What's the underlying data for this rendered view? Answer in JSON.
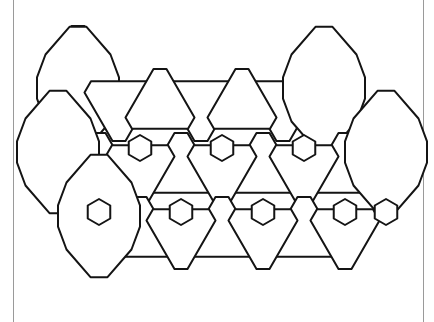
{
  "page": {
    "width": 434,
    "height": 322,
    "background_color": "#ffffff"
  },
  "frame": {
    "name": "page-border-rules",
    "color": "#9a9a9a",
    "left_x": 13,
    "right_x": 423,
    "stroke_width": 1
  },
  "figure": {
    "name": "tessellation-figure",
    "line_color": "#141414",
    "line_width": 2,
    "fill_color": "#ffffff",
    "bounds": {
      "x": 48,
      "y": 24,
      "width": 356,
      "height": 248
    },
    "lattice": {
      "col_pitch": 82,
      "row_pitch": 64,
      "row_offset": 41,
      "triangle_side": 82,
      "truncation": 13,
      "hex_radius": 13
    },
    "counts": {
      "truncated_triangles_up": 10,
      "truncated_triangles_down": 9,
      "truncated_hexagons": 6,
      "small_hexagons": 9
    },
    "shapes": [
      {
        "id": "tri-up-0",
        "type": "truncated-triangle",
        "orientation": "up",
        "cx": 78,
        "cy": 62
      },
      {
        "id": "hex-0",
        "type": "truncated-hexagon",
        "orientation": "flat",
        "cx": 78,
        "cy": 105
      },
      {
        "id": "tri-dn-0",
        "type": "truncated-triangle",
        "orientation": "down",
        "cx": 119,
        "cy": 105
      },
      {
        "id": "hex-1",
        "type": "truncated-hexagon",
        "orientation": "flat",
        "cx": 160,
        "cy": 105
      },
      {
        "id": "tri-dn-1",
        "type": "truncated-triangle",
        "orientation": "down",
        "cx": 201,
        "cy": 105
      },
      {
        "id": "hex-2",
        "type": "truncated-hexagon",
        "orientation": "flat",
        "cx": 242,
        "cy": 105
      },
      {
        "id": "tri-dn-2",
        "type": "truncated-triangle",
        "orientation": "down",
        "cx": 283,
        "cy": 105
      },
      {
        "id": "hex-3",
        "type": "truncated-hexagon",
        "orientation": "flat",
        "cx": 324,
        "cy": 105
      },
      {
        "id": "sh-r1-0",
        "type": "small-hexagon",
        "cx": 140,
        "cy": 148
      },
      {
        "id": "sh-r1-1",
        "type": "small-hexagon",
        "cx": 222,
        "cy": 148
      },
      {
        "id": "sh-r1-2",
        "type": "small-hexagon",
        "cx": 304,
        "cy": 148
      },
      {
        "id": "tri-up-1",
        "type": "truncated-triangle",
        "orientation": "up",
        "cx": 99,
        "cy": 170
      },
      {
        "id": "tri-up-2",
        "type": "truncated-triangle",
        "orientation": "up",
        "cx": 181,
        "cy": 170
      },
      {
        "id": "tri-up-3",
        "type": "truncated-triangle",
        "orientation": "up",
        "cx": 263,
        "cy": 170
      },
      {
        "id": "tri-up-4",
        "type": "truncated-triangle",
        "orientation": "up",
        "cx": 345,
        "cy": 170
      },
      {
        "id": "hex-4",
        "type": "truncated-hexagon",
        "orientation": "flat",
        "cx": 58,
        "cy": 170
      },
      {
        "id": "tri-dn-3",
        "type": "truncated-triangle",
        "orientation": "down",
        "cx": 140,
        "cy": 170
      },
      {
        "id": "tri-dn-4",
        "type": "truncated-triangle",
        "orientation": "down",
        "cx": 222,
        "cy": 170
      },
      {
        "id": "tri-dn-5",
        "type": "truncated-triangle",
        "orientation": "down",
        "cx": 304,
        "cy": 170
      },
      {
        "id": "hex-5",
        "type": "truncated-hexagon",
        "orientation": "flat",
        "cx": 386,
        "cy": 170
      },
      {
        "id": "sh-r2-0",
        "type": "small-hexagon",
        "cx": 99,
        "cy": 212
      },
      {
        "id": "sh-r2-1",
        "type": "small-hexagon",
        "cx": 181,
        "cy": 212
      },
      {
        "id": "sh-r2-2",
        "type": "small-hexagon",
        "cx": 263,
        "cy": 212
      },
      {
        "id": "sh-r2-3",
        "type": "small-hexagon",
        "cx": 345,
        "cy": 212
      },
      {
        "id": "hex-6",
        "type": "truncated-hexagon",
        "orientation": "flat",
        "cx": 78,
        "cy": 235
      },
      {
        "id": "tri-up-5",
        "type": "truncated-triangle",
        "orientation": "up",
        "cx": 140,
        "cy": 235
      },
      {
        "id": "tri-up-6",
        "type": "truncated-triangle",
        "orientation": "up",
        "cx": 222,
        "cy": 235
      },
      {
        "id": "tri-up-7",
        "type": "truncated-triangle",
        "orientation": "up",
        "cx": 304,
        "cy": 235
      },
      {
        "id": "tri-dn-6",
        "type": "truncated-triangle",
        "orientation": "down",
        "cx": 222,
        "cy": 235
      },
      {
        "id": "tri-dn-7",
        "type": "truncated-triangle",
        "orientation": "down",
        "cx": 304,
        "cy": 235
      },
      {
        "id": "hex-7",
        "type": "truncated-hexagon",
        "orientation": "flat",
        "cx": 366,
        "cy": 235
      }
    ],
    "paths": [
      "M 78 24 L 90 31 L 112 69 L 105 82 L 52 82 L 45 69 L 67 31 Z",
      "M 52 88 L 105 88 L 112 101 L 105 114 L 105 130 L 99 142 L 58 142 L 52 130 L 45 114 L 52 101 L 45 101 Z",
      "M 112 69 L 105 82 L 52 82 L 45 69",
      "M 123 78 L 176 78 L 183 91 L 153 142 L 140 142 L 110 91 Z",
      "M 205 78 L 258 78 L 265 91 L 235 142 L 222 142 L 192 91 Z",
      "M 287 78 L 340 78 L 347 91 L 317 142 L 304 142 L 274 91 Z",
      "M 347 91 L 370 91 L 383 104 L 383 130 L 370 143 L 347 143 L 334 130 L 334 104 Z",
      "M 140 142 L 153 142 L 160 155 L 153 168 L 127 168 L 120 155 L 127 142 Z",
      "M 222 142 L 235 142 L 242 155 L 235 168 L 209 168 L 202 155 L 209 142 Z",
      "M 304 142 L 317 142 L 324 155 L 317 168 L 291 168 L 284 155 L 291 142 Z",
      "M 99 142 L 120 155 L 127 168 L 153 168 L 127 206 L 114 206 L 88 168 L 58 142 Z",
      "M 181 142 L 202 155 L 209 168 L 235 168 L 209 206 L 196 206 L 170 168 L 140 142 Z",
      "M 263 142 L 284 155 L 291 168 L 317 168 L 291 206 L 278 206 L 252 168 L 222 142 Z",
      "M 345 142 L 366 155 L 373 168 L 399 168 L 373 206 L 360 206 L 334 168 L 304 142 Z",
      "M 45 155 L 88 155 L 99 168 L 88 181 L 88 199 L 78 212 L 52 212 L 40 199 L 32 181 L 40 168 Z",
      "M 99 199 L 112 199 L 119 212 L 112 225 L 86 225 L 79 212 L 86 199 Z",
      "M 181 199 L 194 199 L 201 212 L 194 225 L 168 225 L 161 212 L 168 199 Z",
      "M 263 199 L 276 199 L 283 212 L 276 225 L 250 225 L 243 212 L 250 199 Z",
      "M 345 199 L 358 199 L 365 212 L 358 225 L 332 225 L 325 212 L 332 199 Z",
      "M 86 225 L 112 225 L 138 263 L 131 272 L 78 272 L 71 263 L 60 225 Z",
      "M 168 225 L 194 225 L 220 263 L 213 272 L 160 272 L 153 263 Z",
      "M 250 225 L 276 225 L 302 263 L 295 272 L 242 272 L 235 263 Z",
      "M 332 225 L 358 225 L 384 263 L 377 272 L 324 272 L 317 263 Z"
    ]
  }
}
